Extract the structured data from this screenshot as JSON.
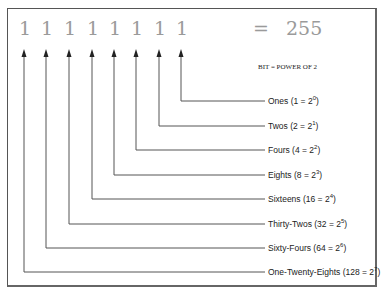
{
  "diagram": {
    "bits": [
      "1",
      "1",
      "1",
      "1",
      "1",
      "1",
      "1",
      "1"
    ],
    "equals": "=",
    "result": "255",
    "legend_note": "BIT = POWER OF 2",
    "labels": [
      {
        "name": "Ones",
        "value": "1",
        "exp": "0"
      },
      {
        "name": "Twos",
        "value": "2",
        "exp": "1"
      },
      {
        "name": "Fours",
        "value": "4",
        "exp": "2"
      },
      {
        "name": "Eights",
        "value": "8",
        "exp": "3"
      },
      {
        "name": "Sixteens",
        "value": "16",
        "exp": "4"
      },
      {
        "name": "Thirty-Twos",
        "value": "32",
        "exp": "5"
      },
      {
        "name": "Sixty-Fours",
        "value": "64",
        "exp": "6"
      },
      {
        "name": "One-Twenty-Eights",
        "value": "128",
        "exp": "7"
      }
    ],
    "colors": {
      "bits": "#9a9a9a",
      "lines": "#555555",
      "text": "#222222"
    }
  }
}
